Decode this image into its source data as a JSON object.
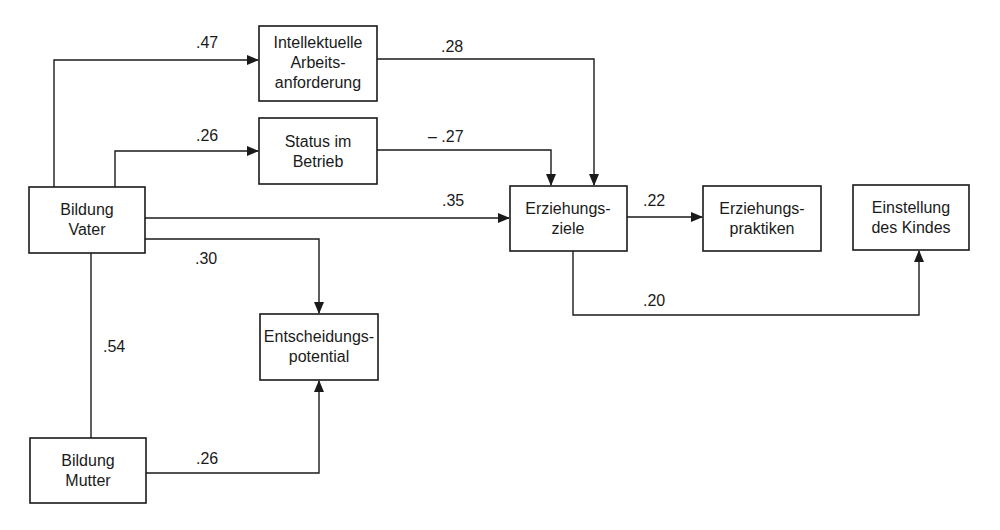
{
  "diagram": {
    "type": "path-diagram",
    "nodes": {
      "intellektuelle": {
        "line1": "Intellektuelle",
        "line2": "Arbeits-",
        "line3": "anforderung"
      },
      "status": {
        "line1": "Status im",
        "line2": "Betrieb"
      },
      "bildung_vater": {
        "line1": "Bildung",
        "line2": "Vater"
      },
      "erziehungsziele": {
        "line1": "Erziehungs-",
        "line2": "ziele"
      },
      "erziehungspraktiken": {
        "line1": "Erziehungs-",
        "line2": "praktiken"
      },
      "einstellung": {
        "line1": "Einstellung",
        "line2": "des Kindes"
      },
      "entscheidungspotential": {
        "line1": "Entscheidungs-",
        "line2": "potential"
      },
      "bildung_mutter": {
        "line1": "Bildung",
        "line2": "Mutter"
      }
    },
    "edges": {
      "vater_to_intellektuelle": {
        "from": "Bildung Vater",
        "to": "Intellektuelle Arbeitsanforderung",
        "label": ".47"
      },
      "vater_to_status": {
        "from": "Bildung Vater",
        "to": "Status im Betrieb",
        "label": ".26"
      },
      "intellektuelle_to_ziele": {
        "from": "Intellektuelle Arbeitsanforderung",
        "to": "Erziehungsziele",
        "label": ".28"
      },
      "status_to_ziele": {
        "from": "Status im Betrieb",
        "to": "Erziehungsziele",
        "label": "– .27"
      },
      "vater_to_ziele": {
        "from": "Bildung Vater",
        "to": "Erziehungsziele",
        "label": ".35"
      },
      "ziele_to_praktiken": {
        "from": "Erziehungsziele",
        "to": "Erziehungspraktiken",
        "label": ".22"
      },
      "ziele_to_einstellung": {
        "from": "Erziehungsziele",
        "to": "Einstellung des Kindes",
        "label": ".20"
      },
      "vater_to_entscheidung": {
        "from": "Bildung Vater",
        "to": "Entscheidungspotential",
        "label": ".30"
      },
      "vater_mutter": {
        "from": "Bildung Vater",
        "to": "Bildung Mutter",
        "label": ".54"
      },
      "mutter_to_entscheidung": {
        "from": "Bildung Mutter",
        "to": "Entscheidungspotential",
        "label": ".26"
      }
    }
  }
}
